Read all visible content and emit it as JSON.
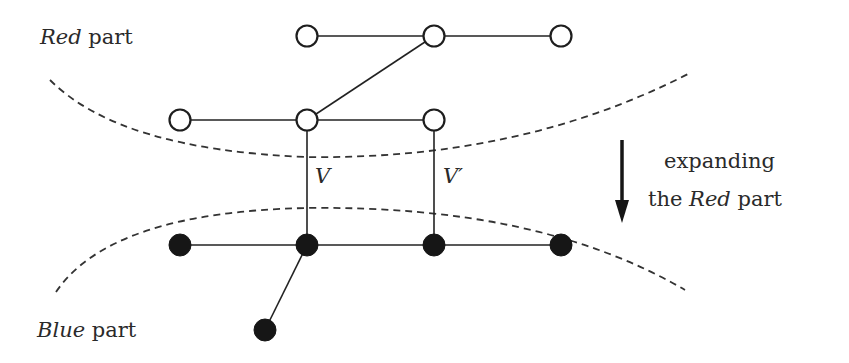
{
  "labels": {
    "red_part": {
      "italic": "Red",
      "rest": " part"
    },
    "blue_part": {
      "italic": "Blue",
      "rest": " part"
    },
    "edge_v": "V",
    "edge_v_prime": "V′",
    "arrow_caption": {
      "line1": "expanding",
      "line2_pre": "the ",
      "line2_italic": "Red",
      "line2_post": " part"
    }
  },
  "colors": {
    "stroke": "#222222",
    "red_node_fill": "#ffffff",
    "blue_node_fill": "#161616",
    "background": "#ffffff"
  },
  "graph": {
    "red_nodes": [
      {
        "id": "r1",
        "x": 307,
        "y": 36
      },
      {
        "id": "r2",
        "x": 434,
        "y": 36
      },
      {
        "id": "r3",
        "x": 561,
        "y": 36
      },
      {
        "id": "r4",
        "x": 180,
        "y": 120
      },
      {
        "id": "r5",
        "x": 307,
        "y": 120
      },
      {
        "id": "r6",
        "x": 434,
        "y": 120
      }
    ],
    "blue_nodes": [
      {
        "id": "b1",
        "x": 180,
        "y": 245
      },
      {
        "id": "b2",
        "x": 307,
        "y": 245
      },
      {
        "id": "b3",
        "x": 434,
        "y": 245
      },
      {
        "id": "b4",
        "x": 561,
        "y": 245
      },
      {
        "id": "b5",
        "x": 265,
        "y": 330
      }
    ],
    "edges": [
      [
        "r1",
        "r2"
      ],
      [
        "r2",
        "r3"
      ],
      [
        "r2",
        "r5"
      ],
      [
        "r4",
        "r5"
      ],
      [
        "r5",
        "r6"
      ],
      [
        "r5",
        "b2"
      ],
      [
        "r6",
        "b3"
      ],
      [
        "b1",
        "b2"
      ],
      [
        "b2",
        "b3"
      ],
      [
        "b3",
        "b4"
      ],
      [
        "b2",
        "b5"
      ]
    ]
  }
}
